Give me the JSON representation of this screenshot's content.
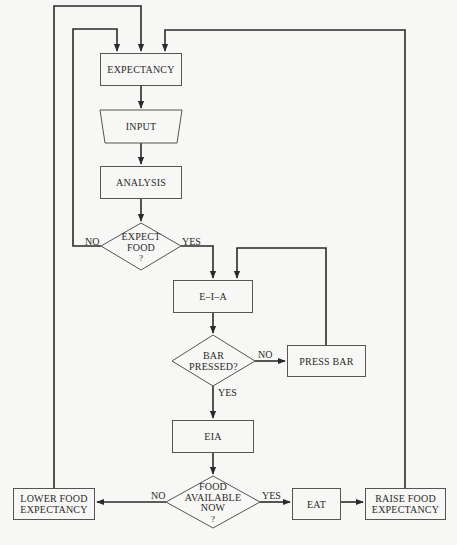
{
  "diagram": {
    "type": "flowchart",
    "colors": {
      "background": "#f7f7f5",
      "stroke": "#2a2a2a",
      "box_border": "#555555"
    },
    "nodes": {
      "expectancy": {
        "shape": "rectangle",
        "label": "EXPECTANCY"
      },
      "input": {
        "shape": "trapezoid",
        "label": "INPUT"
      },
      "analysis": {
        "shape": "rectangle",
        "label": "ANALYSIS"
      },
      "expect_food": {
        "shape": "diamond",
        "line1": "EXPECT",
        "line2": "FOOD",
        "line3": "?"
      },
      "eia_upper": {
        "shape": "rectangle",
        "label": "E–I–A"
      },
      "bar_pressed": {
        "shape": "diamond",
        "line1": "BAR",
        "line2": "PRESSED?"
      },
      "press_bar": {
        "shape": "rectangle",
        "label": "PRESS BAR"
      },
      "eia_lower": {
        "shape": "rectangle",
        "label": "EIA"
      },
      "food_available": {
        "shape": "diamond",
        "line1": "FOOD",
        "line2": "AVAILABLE",
        "line3": "NOW",
        "line4": "?"
      },
      "lower_food": {
        "shape": "rectangle",
        "line1": "LOWER FOOD",
        "line2": "EXPECTANCY"
      },
      "eat": {
        "shape": "rectangle",
        "label": "EAT"
      },
      "raise_food": {
        "shape": "rectangle",
        "line1": "RAISE FOOD",
        "line2": "EXPECTANCY"
      }
    },
    "edge_labels": {
      "expect_food_no": "NO",
      "expect_food_yes": "YES",
      "bar_pressed_no": "NO",
      "bar_pressed_yes": "YES",
      "food_available_no": "NO",
      "food_available_yes": "YES"
    },
    "edges": [
      {
        "from": "expectancy",
        "to": "input"
      },
      {
        "from": "input",
        "to": "analysis"
      },
      {
        "from": "analysis",
        "to": "expect_food"
      },
      {
        "from": "expect_food",
        "to": "expectancy",
        "label": "NO"
      },
      {
        "from": "expect_food",
        "to": "eia_upper",
        "label": "YES"
      },
      {
        "from": "eia_upper",
        "to": "bar_pressed"
      },
      {
        "from": "bar_pressed",
        "to": "press_bar",
        "label": "NO"
      },
      {
        "from": "press_bar",
        "to": "eia_upper"
      },
      {
        "from": "bar_pressed",
        "to": "eia_lower",
        "label": "YES"
      },
      {
        "from": "eia_lower",
        "to": "food_available"
      },
      {
        "from": "food_available",
        "to": "lower_food",
        "label": "NO"
      },
      {
        "from": "food_available",
        "to": "eat",
        "label": "YES"
      },
      {
        "from": "eat",
        "to": "raise_food"
      },
      {
        "from": "lower_food",
        "to": "expectancy"
      },
      {
        "from": "raise_food",
        "to": "expectancy"
      }
    ]
  }
}
